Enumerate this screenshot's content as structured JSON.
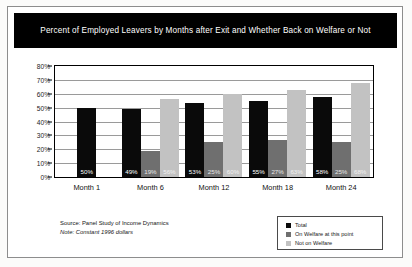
{
  "chart_data": {
    "type": "bar",
    "title": "Percent of Employed Leavers by Months after Exit and Whether Back on Welfare or Not",
    "xlabel": "",
    "ylabel": "",
    "ylim": [
      0,
      80
    ],
    "grid": true,
    "legend_position": "bottom-right",
    "categories": [
      "Month 1",
      "Month 6",
      "Month 12",
      "Month 18",
      "Month 24"
    ],
    "ytick_labels": [
      "0%",
      "10%",
      "20%",
      "30%",
      "40%",
      "50%",
      "60%",
      "70%",
      "80%"
    ],
    "ytick_values": [
      0,
      10,
      20,
      30,
      40,
      50,
      60,
      70,
      80
    ],
    "series": [
      {
        "name": "Total",
        "color": "#0a0a0a",
        "values": [
          50,
          49,
          53,
          55,
          58
        ],
        "labels": [
          "50%",
          "49%",
          "53%",
          "55%",
          "58%"
        ]
      },
      {
        "name": "On Welfare at this point",
        "color": "#6f6f6f",
        "values": [
          null,
          19,
          25,
          27,
          25
        ],
        "labels": [
          null,
          "19%",
          "25%",
          "27%",
          "25%"
        ]
      },
      {
        "name": "Not on Welfare",
        "color": "#c2c2c2",
        "values": [
          null,
          56,
          60,
          63,
          68
        ],
        "labels": [
          null,
          "56%",
          "60%",
          "63%",
          "68%"
        ]
      }
    ],
    "annotations": [
      "Source: Panel Study of Income Dynamics",
      "Note: Constant 1996 dollars"
    ]
  },
  "footnotes": {
    "source": "Source: Panel Study of Income Dynamics",
    "note": "Note: Constant 1996 dollars"
  },
  "legend": {
    "items": [
      {
        "label": "Total",
        "color": "#0a0a0a"
      },
      {
        "label": "On Welfare at this point",
        "color": "#6f6f6f"
      },
      {
        "label": "Not on Welfare",
        "color": "#c2c2c2"
      }
    ]
  }
}
